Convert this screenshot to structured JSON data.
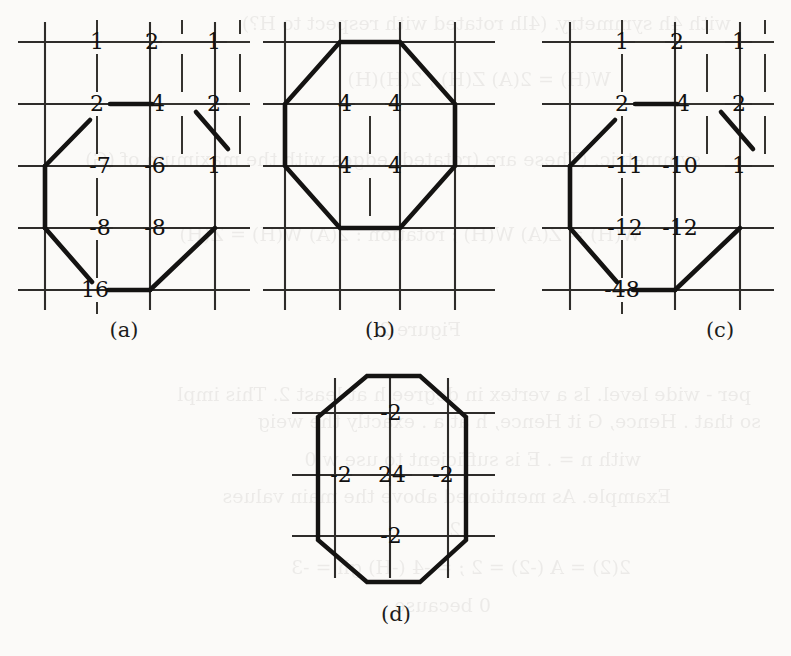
{
  "figure": {
    "ink_color": "#141312",
    "grid_color": "#3a3836",
    "paper_color": "#fbfaf8"
  },
  "panels": [
    {
      "id": "a",
      "caption": "(a)",
      "rows": [
        {
          "cells": [
            "1",
            "2",
            "1"
          ]
        },
        {
          "cells": [
            "2",
            "4",
            "2"
          ]
        },
        {
          "cells": [
            "-7",
            "-6",
            "1"
          ]
        },
        {
          "cells": [
            "-8",
            "-8",
            ""
          ]
        },
        {
          "cells": [
            "16",
            "",
            ""
          ]
        }
      ]
    },
    {
      "id": "b",
      "caption": "(b)",
      "rows": [
        {
          "cells": [
            "",
            "",
            ""
          ]
        },
        {
          "cells": [
            "",
            "",
            ""
          ]
        },
        {
          "cells": [
            "",
            "4",
            "4",
            ""
          ]
        },
        {
          "cells": [
            "",
            "4",
            "4",
            ""
          ]
        },
        {
          "cells": [
            "",
            "",
            ""
          ]
        }
      ]
    },
    {
      "id": "c",
      "caption": "(c)",
      "rows": [
        {
          "cells": [
            "1",
            "2",
            "1"
          ]
        },
        {
          "cells": [
            "2",
            "4",
            "2"
          ]
        },
        {
          "cells": [
            "-11",
            "-10",
            "1"
          ]
        },
        {
          "cells": [
            "-12",
            "-12",
            ""
          ]
        },
        {
          "cells": [
            "-48",
            "",
            ""
          ]
        }
      ]
    },
    {
      "id": "d",
      "caption": "(d)",
      "rows": [
        {
          "cells": [
            "",
            "-2",
            ""
          ]
        },
        {
          "cells": [
            "-2",
            "24",
            "-2"
          ]
        },
        {
          "cells": [
            "",
            "-2",
            ""
          ]
        }
      ]
    }
  ],
  "panel_a_values": {
    "r1": [
      "1",
      "2",
      "1"
    ],
    "r2": [
      "2",
      "4",
      "2"
    ],
    "r3": [
      "-7",
      "-6",
      "1"
    ],
    "r4": [
      "-8",
      "-8"
    ],
    "r5": [
      "16"
    ]
  },
  "panel_b_values": {
    "r3": [
      "4",
      "4"
    ],
    "r4": [
      "4",
      "4"
    ]
  },
  "panel_c_values": {
    "r1": [
      "1",
      "2",
      "1"
    ],
    "r2": [
      "2",
      "4",
      "2"
    ],
    "r3": [
      "-11",
      "-10",
      "1"
    ],
    "r4": [
      "-12",
      "-12"
    ],
    "r5": [
      "-48"
    ]
  },
  "panel_d_values": {
    "top": "-2",
    "left": "-2",
    "center": "24",
    "right": "-2",
    "bottom": "-2"
  },
  "captions": {
    "a": "(a)",
    "b": "(b)",
    "c": "(c)",
    "d": "(d)"
  },
  "background_bleed": {
    "lines": [
      "with 4h symmetry.  (4lh rotated with respect to H?)",
      "W(H) = 2(A) Z(H) ;  2(H)(H)",
      "symmetric. (These are (rotated) edges with the maximum of  (G)",
      "W(H) = Z(A) W(H) ; rotation :  2(A) W(H) = Z(H)",
      "Figure 2",
      "per - wide level.   Is a vertex in degree h  at least 2.  This impl",
      "so that .  Hence, G it  Hence, h at  a .  exactly the weig",
      "with  n  = . E is sufficient to use  w 0",
      "Example.  As mentioned above the main values",
      "2",
      "2(2) = A    (-2) = 2 ; = -4 (-H) gh = -3",
      "0        because"
    ]
  }
}
